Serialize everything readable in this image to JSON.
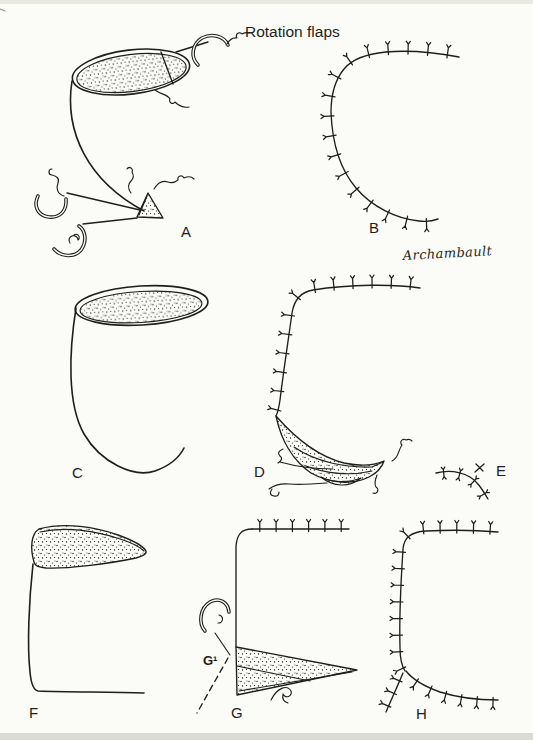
{
  "figure": {
    "title": "Rotation flaps",
    "signature": "Archambault",
    "colors": {
      "ink": "#1e1e1c",
      "paper": "#fbfbf8"
    },
    "panels": [
      {
        "id": "A",
        "label": "A"
      },
      {
        "id": "B",
        "label": "B"
      },
      {
        "id": "C",
        "label": "C"
      },
      {
        "id": "D",
        "label": "D"
      },
      {
        "id": "E",
        "label": "E"
      },
      {
        "id": "F",
        "label": "F"
      },
      {
        "id": "G",
        "label": "G"
      },
      {
        "id": "G1",
        "label": "G¹"
      },
      {
        "id": "H",
        "label": "H"
      }
    ]
  }
}
